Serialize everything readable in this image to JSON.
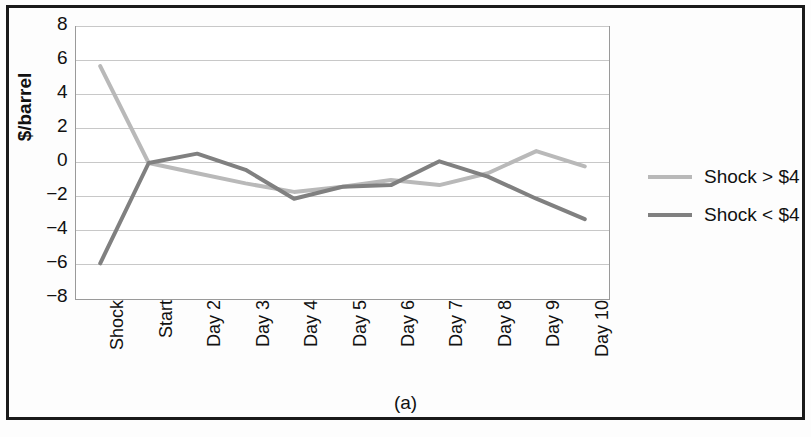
{
  "caption": "(a)",
  "legend": {
    "position": "right",
    "entries": [
      {
        "label": "Shock > $4",
        "color": "#b9b9b9"
      },
      {
        "label": "Shock < $4",
        "color": "#808080"
      }
    ]
  },
  "axes": {
    "ylabel": "$/barrel",
    "yticks": [
      "8",
      "6",
      "4",
      "2",
      "0",
      "-2",
      "-4",
      "-6",
      "-8"
    ],
    "xticks": [
      "Shock",
      "Start",
      "Day 2",
      "Day 3",
      "Day 4",
      "Day 5",
      "Day 6",
      "Day 7",
      "Day 8",
      "Day 9",
      "Day 10"
    ]
  },
  "chart_data": {
    "type": "line",
    "title": "",
    "subtitle": "",
    "xlabel": "",
    "ylabel": "$/barrel",
    "categories": [
      "Shock",
      "Start",
      "Day 2",
      "Day 3",
      "Day 4",
      "Day 5",
      "Day 6",
      "Day 7",
      "Day 8",
      "Day 9",
      "Day 10"
    ],
    "series": [
      {
        "name": "Shock > $4",
        "color": "#b9b9b9",
        "values": [
          5.7,
          0.0,
          -0.6,
          -1.2,
          -1.7,
          -1.4,
          -1.0,
          -1.3,
          -0.6,
          0.7,
          -0.2
        ]
      },
      {
        "name": "Shock < $4",
        "color": "#808080",
        "values": [
          -5.9,
          0.0,
          0.55,
          -0.4,
          -2.1,
          -1.4,
          -1.3,
          0.1,
          -0.8,
          -2.1,
          -3.3
        ]
      }
    ],
    "ylim": [
      -8,
      8
    ],
    "ytick_step": 2,
    "grid": "horizontal",
    "legend_position": "right",
    "annotations": [
      "(a)"
    ]
  }
}
